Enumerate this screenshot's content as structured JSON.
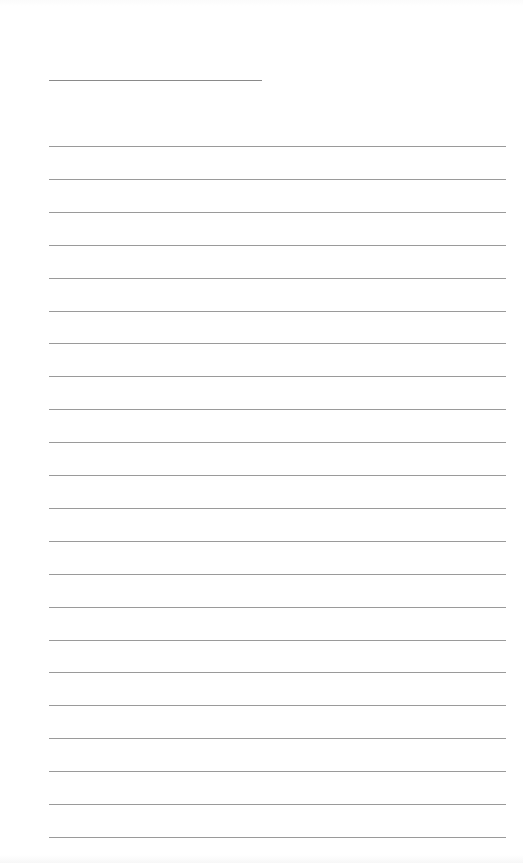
{
  "page": {
    "type": "lined-notepad",
    "background_color": "#ffffff",
    "rule_color": "#9a9a9a",
    "title": {
      "text": "",
      "line_left": 49,
      "line_top": 80,
      "line_width": 213
    },
    "rules": {
      "count": 22,
      "left": 49,
      "width": 457,
      "first_top": 146,
      "spacing": 32.9,
      "lines": [
        "",
        "",
        "",
        "",
        "",
        "",
        "",
        "",
        "",
        "",
        "",
        "",
        "",
        "",
        "",
        "",
        "",
        "",
        "",
        "",
        "",
        ""
      ]
    }
  }
}
